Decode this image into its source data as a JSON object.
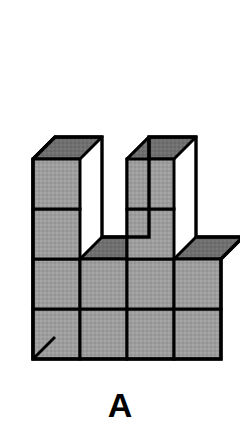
{
  "figure": {
    "label": "A",
    "kind": "isometric-cube-stack",
    "colors": {
      "front_face": "#9d9d9d",
      "top_face": "#6f6f6f",
      "side_face": "#6f6f6f",
      "outline": "#000000",
      "background": "#ffffff",
      "label_color": "#000000"
    },
    "geometry": {
      "cube_width": 47,
      "cube_height": 50,
      "depth_dx": 22,
      "depth_dy": -22,
      "origin_x": 33,
      "origin_y": 359,
      "columns": 4,
      "column_heights": [
        4,
        2,
        4,
        2
      ],
      "total_cubes_visible": 12
    }
  },
  "caption": {
    "text": "A"
  }
}
